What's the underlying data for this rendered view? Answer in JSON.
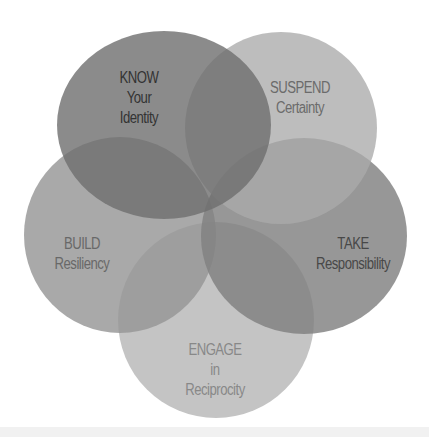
{
  "diagram": {
    "type": "five-circle overlapping venn",
    "circles": [
      {
        "id": "know",
        "lines": [
          "KNOW",
          "Your",
          "Identity"
        ],
        "fill": "#7a7a7a",
        "opacity": 0.88,
        "text_color": "#3a3a3a"
      },
      {
        "id": "suspend",
        "lines": [
          "SUSPEND",
          "Certainty"
        ],
        "fill": "#b3b3b3",
        "opacity": 0.85,
        "text_color": "#6e6e6e"
      },
      {
        "id": "build",
        "lines": [
          "BUILD",
          "Resiliency"
        ],
        "fill": "#a2a2a2",
        "opacity": 0.85,
        "text_color": "#6a6a6a"
      },
      {
        "id": "take",
        "lines": [
          "TAKE",
          "Responsibility"
        ],
        "fill": "#8e8e8e",
        "opacity": 0.85,
        "text_color": "#4a4a4a"
      },
      {
        "id": "engage",
        "lines": [
          "ENGAGE",
          "in",
          "Reciprocity"
        ],
        "fill": "#c2c2c2",
        "opacity": 0.82,
        "text_color": "#8a8a8a"
      }
    ]
  }
}
